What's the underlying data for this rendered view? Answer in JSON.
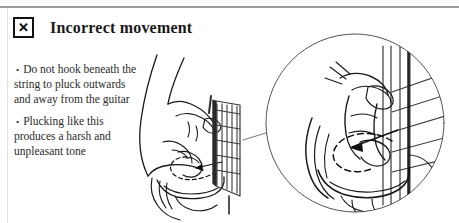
{
  "page": {
    "background": "#ffffff",
    "rule_color": "#9a9a9a"
  },
  "header": {
    "icon_glyph": "✕",
    "icon_name": "x-mark-icon",
    "title": "Incorrect movement"
  },
  "body": {
    "bullets": [
      {
        "marker": "•",
        "text": "Do not hook beneath the string to pluck outwards and away from the guitar"
      },
      {
        "marker": "•",
        "text": "Plucking like this produces a harsh and unpleasant tone"
      }
    ]
  },
  "illustration": {
    "main_caption": "hand plucking guitar fretboard from below",
    "detail_caption": "magnified circular inset of finger hooking under string",
    "ink_color": "#1a1a1a",
    "callout_circle_color": "#555555"
  }
}
